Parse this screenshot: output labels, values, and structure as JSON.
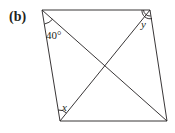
{
  "figure": {
    "part_label": "(b)",
    "shape": "parallelogram with diagonals",
    "angles": {
      "top_left": "40°",
      "top_right": "y",
      "bottom_left": "x"
    },
    "line_color": "#231f20"
  }
}
